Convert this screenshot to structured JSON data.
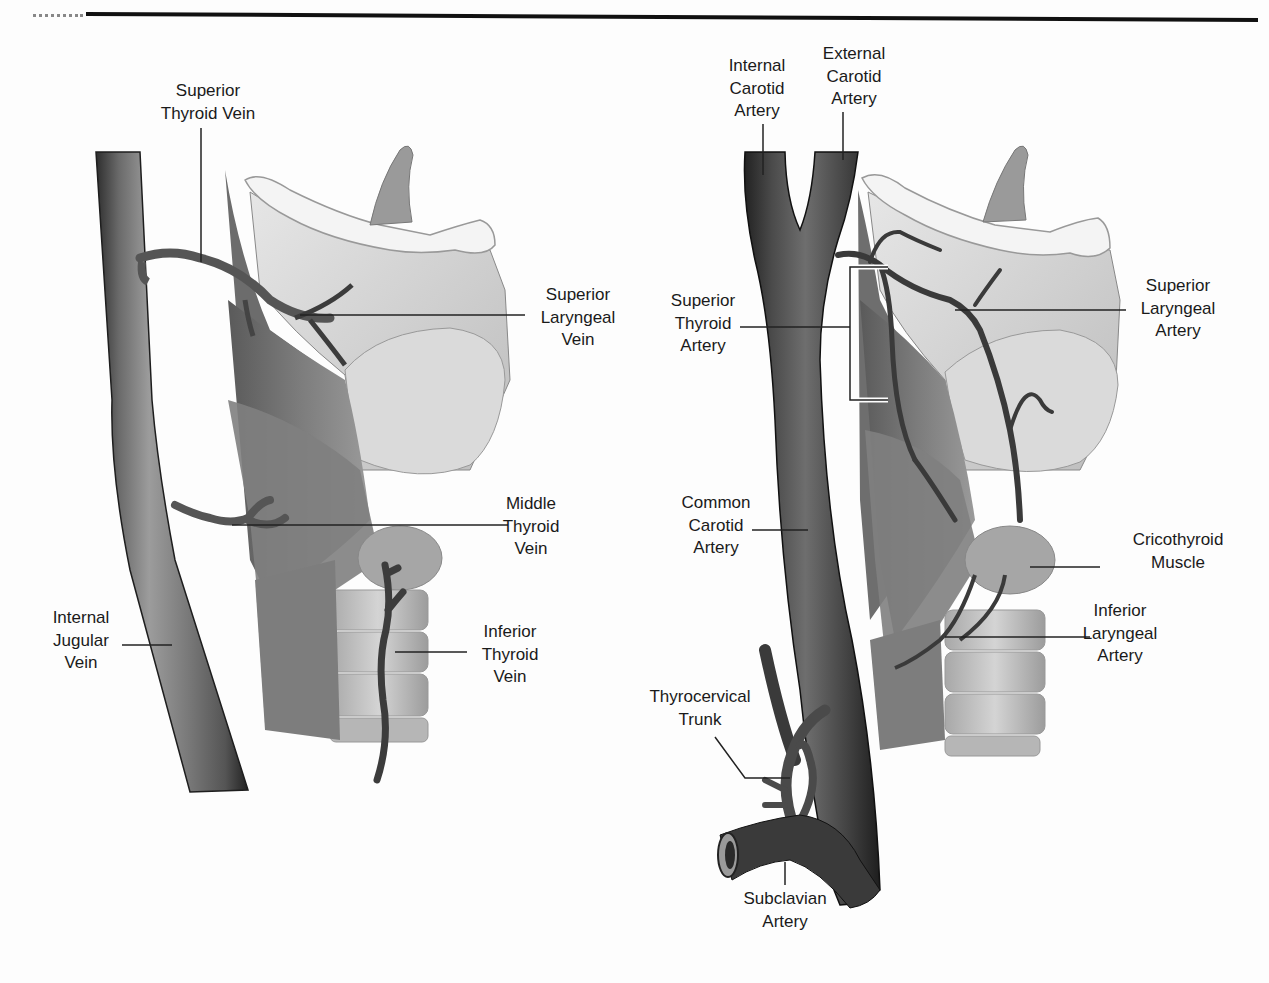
{
  "figure": {
    "panels": [
      {
        "id": "left",
        "topic": "veins"
      },
      {
        "id": "right",
        "topic": "arteries"
      }
    ],
    "colors": {
      "vessel_dark": "#3c3c3c",
      "vessel_mid": "#6e6e6e",
      "vessel_light": "#9a9a9a",
      "muscle": "#8a8a8a",
      "cartilage": "#d6d6d6",
      "cartilage_highlight": "#f4f4f4",
      "rule": "#111111",
      "background": "#fdfdfd"
    }
  },
  "labels": {
    "superior_thyroid_vein": {
      "lines": [
        "Superior",
        "Thyroid Vein"
      ]
    },
    "superior_laryngeal_vein": {
      "lines": [
        "Superior",
        "Laryngeal",
        "Vein"
      ]
    },
    "middle_thyroid_vein": {
      "lines": [
        "Middle",
        "Thyroid",
        "Vein"
      ]
    },
    "internal_jugular_vein": {
      "lines": [
        "Internal",
        "Jugular",
        "Vein"
      ]
    },
    "inferior_thyroid_vein": {
      "lines": [
        "Inferior",
        "Thyroid",
        "Vein"
      ]
    },
    "internal_carotid_artery": {
      "lines": [
        "Internal",
        "Carotid",
        "Artery"
      ]
    },
    "external_carotid_artery": {
      "lines": [
        "External",
        "Carotid",
        "Artery"
      ]
    },
    "superior_thyroid_artery": {
      "lines": [
        "Superior",
        "Thyroid",
        "Artery"
      ]
    },
    "superior_laryngeal_artery": {
      "lines": [
        "Superior",
        "Laryngeal",
        "Artery"
      ]
    },
    "common_carotid_artery": {
      "lines": [
        "Common",
        "Carotid",
        "Artery"
      ]
    },
    "cricothyroid_muscle": {
      "lines": [
        "Cricothyroid",
        "Muscle"
      ]
    },
    "inferior_laryngeal_artery": {
      "lines": [
        "Inferior",
        "Laryngeal",
        "Artery"
      ]
    },
    "thyrocervical_trunk": {
      "lines": [
        "Thyrocervical",
        "Trunk"
      ]
    },
    "subclavian_artery": {
      "lines": [
        "Subclavian",
        "Artery"
      ]
    }
  }
}
